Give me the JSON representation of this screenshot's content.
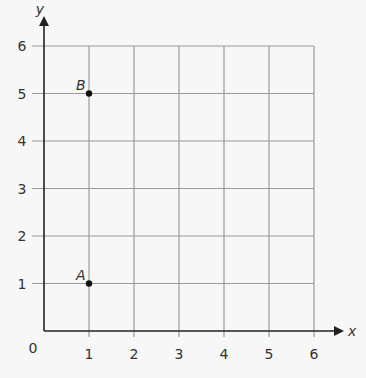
{
  "chart_data": {
    "type": "scatter",
    "title": "",
    "xlabel": "x",
    "ylabel": "y",
    "xlim": [
      0,
      6
    ],
    "ylim": [
      0,
      6
    ],
    "grid": true,
    "x_ticks": [
      "1",
      "2",
      "3",
      "4",
      "5",
      "6"
    ],
    "y_ticks": [
      "1",
      "2",
      "3",
      "4",
      "5",
      "6"
    ],
    "origin_label": "0",
    "points": [
      {
        "label": "A",
        "x": 1,
        "y": 1
      },
      {
        "label": "B",
        "x": 1,
        "y": 5
      }
    ]
  },
  "colors": {
    "background": "#f7f7f7",
    "grid": "#9a9a9a",
    "axis": "#222222",
    "point": "#111111",
    "text": "#333333"
  }
}
